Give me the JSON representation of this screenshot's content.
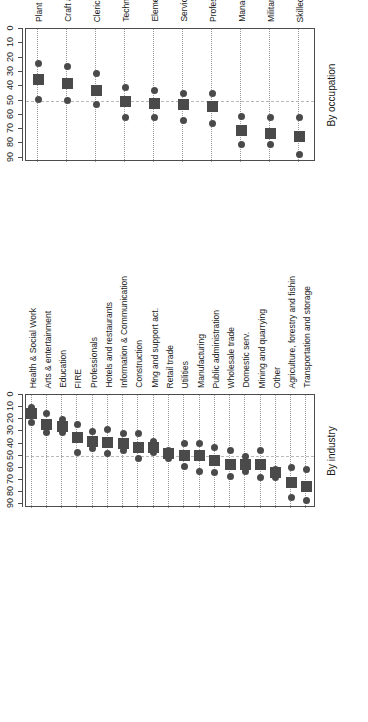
{
  "figure": {
    "axis_title": "Foreign premium",
    "axis_subtitle": "(additional % of native workers' wage)",
    "reference_value": 50
  },
  "panels": [
    {
      "title": "By industry",
      "axis_title": "Foreign premium",
      "axis_subtitle": "(additional % of native workers' wage)"
    },
    {
      "title": "By occupation",
      "axis_title": "Foreign premium",
      "axis_subtitle": "(additional % of native workers' wage)"
    }
  ],
  "ticks": [
    "0",
    "10",
    "20",
    "30",
    "40",
    "50",
    "60",
    "70",
    "80",
    "90"
  ],
  "chart_data": [
    {
      "type": "scatter",
      "title": "By industry",
      "xlabel": "Foreign premium",
      "xlabel_sub": "(additional % of native workers' wage)",
      "ylabel": "",
      "xlim": [
        0,
        93
      ],
      "xticks": [
        0,
        10,
        20,
        30,
        40,
        50,
        60,
        70,
        80,
        90
      ],
      "grid": "dotted category lines",
      "reference_line": 50,
      "marker_estimate": "square",
      "marker_bounds": "circle",
      "categories": [
        "Transportation and storage",
        "Agriculture, forestry and fishin",
        "Other",
        "Mining and quarrying",
        "Domestic serv.",
        "Wholesale trade",
        "Public administration",
        "Manufacturing",
        "Utilities",
        "Retail trade",
        "Mng and support act.",
        "Construction",
        "Information & Communication",
        "Hotels and restaurants",
        "Professionals",
        "FIRE",
        "Education",
        "Arts & entertainment",
        "Health & Social Work"
      ],
      "series": [
        {
          "name": "Estimate",
          "values": [
            75,
            72,
            64,
            57,
            57,
            57,
            54,
            50,
            50,
            48,
            43,
            43,
            40,
            39,
            38,
            35,
            26,
            24,
            15
          ]
        },
        {
          "name": "Upper bound",
          "values": [
            87,
            84,
            68,
            68,
            63,
            67,
            64,
            63,
            59,
            52,
            47,
            52,
            46,
            48,
            44,
            47,
            31,
            31,
            23
          ]
        },
        {
          "name": "Lower bound",
          "values": [
            61,
            60,
            61,
            46,
            51,
            46,
            43,
            40,
            40,
            46,
            38,
            32,
            32,
            28,
            30,
            24,
            20,
            15,
            10
          ]
        }
      ]
    },
    {
      "type": "scatter",
      "title": "By occupation",
      "xlabel": "Foreign premium",
      "xlabel_sub": "(additional % of native workers' wage)",
      "ylabel": "",
      "xlim": [
        0,
        93
      ],
      "xticks": [
        0,
        10,
        20,
        30,
        40,
        50,
        60,
        70,
        80,
        90
      ],
      "grid": "dotted category lines",
      "reference_line": 50,
      "marker_estimate": "square",
      "marker_bounds": "circle",
      "categories": [
        "Skilled Agricultural, Forestry a",
        "Military",
        "Managers",
        "Professionals",
        "Services and Sales Workers",
        "Elementary Occupations",
        "Technicians and Associate Profes",
        "Clerical Support Workers",
        "Craft and Related Trades Workers",
        "Plant and Machine Operators and"
      ],
      "series": [
        {
          "name": "Estimate",
          "values": [
            75,
            73,
            71,
            54,
            53,
            52,
            51,
            43,
            38,
            35
          ]
        },
        {
          "name": "Upper bound",
          "values": [
            88,
            81,
            81,
            66,
            64,
            62,
            62,
            53,
            50,
            49
          ]
        },
        {
          "name": "Lower bound",
          "values": [
            62,
            62,
            61,
            45,
            45,
            43,
            41,
            31,
            26,
            24
          ]
        }
      ]
    }
  ]
}
